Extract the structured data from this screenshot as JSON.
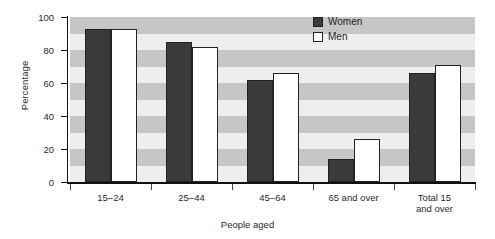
{
  "chart_data": {
    "type": "bar",
    "title": "",
    "subtitle": "",
    "xlabel": "People aged",
    "ylabel": "Percentage",
    "categories": [
      "15–24",
      "25–44",
      "45–64",
      "65 and over",
      "Total 15\nand over"
    ],
    "series": [
      {
        "name": "Women",
        "values": [
          93,
          85,
          62,
          14,
          66
        ],
        "color": "#3a3a3a"
      },
      {
        "name": "Men",
        "values": [
          93,
          82,
          66,
          26,
          71
        ],
        "color": "#ffffff"
      }
    ],
    "ylim": [
      0,
      100
    ],
    "yticks": [
      0,
      20,
      40,
      60,
      80,
      100
    ],
    "ytick_labels": [
      "0",
      "20",
      "40",
      "60",
      "80",
      "100"
    ],
    "grid": "horizontal-alternating-bands",
    "band_interval": 10,
    "legend_position": "top-right",
    "legend_entries": [
      "Women",
      "Men"
    ],
    "colors": {
      "women_fill": "#3a3a3a",
      "men_fill": "#ffffff",
      "bar_outline": "#222222",
      "band_light": "#eeeeee",
      "band_dark": "#c6c6c6",
      "axis": "#111111",
      "text": "#2b2b2b"
    }
  }
}
